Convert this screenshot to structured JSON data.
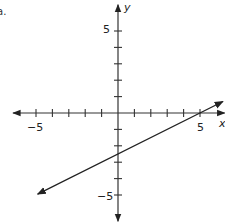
{
  "choice_label": "a.",
  "chart_data": {
    "type": "line",
    "title": "",
    "xlabel": "x",
    "ylabel": "y",
    "xlim": [
      -6.4,
      6.5
    ],
    "ylim": [
      -6.6,
      6.6
    ],
    "x_ticks": [
      -6,
      -5,
      -4,
      -3,
      -2,
      -1,
      1,
      2,
      3,
      4,
      5
    ],
    "y_ticks": [
      -5,
      -4,
      -3,
      -2,
      -1,
      1,
      2,
      3,
      4,
      5
    ],
    "tick_labels": {
      "x": [
        "-5",
        "5"
      ],
      "y": [
        "5",
        "-5"
      ]
    },
    "grid": false,
    "series": [
      {
        "name": "line",
        "equation": "y = 0.5x - 2.5",
        "slope": 0.5,
        "intercept": -2.5,
        "x": [
          -4.9,
          0,
          5,
          6.4
        ],
        "y": [
          -4.95,
          -2.5,
          0,
          0.7
        ],
        "arrows": "both"
      }
    ],
    "colors": {
      "axis": "#333333",
      "line": "#222222"
    }
  },
  "labels": {
    "x_axis": "x",
    "y_axis": "y",
    "x_neg5": "−5",
    "x_pos5": "5",
    "y_pos5": "5",
    "y_neg5": "−5"
  }
}
